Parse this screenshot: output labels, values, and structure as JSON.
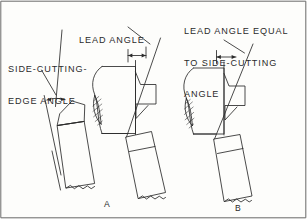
{
  "figure": {
    "title_visible": false,
    "background_color": "#fdfdfb",
    "ink_color": "#2b2b2b",
    "border": {
      "present": true,
      "color": "#5a5a5a"
    },
    "width_px": 307,
    "height_px": 219
  },
  "labels": {
    "side_cutting_edge_angle": {
      "line1": "SIDE-CUTTING-",
      "line2": "EDGE ANGLE",
      "leader": "diagonal-leader-down-right"
    },
    "lead_angle": {
      "line1": "LEAD ANGLE",
      "leader": "diagonal-leader-down-right"
    },
    "lead_angle_equal": {
      "line1": "LEAD ANGLE EQUAL",
      "line2": "TO SIDE-CUTTING",
      "line3": "ANGLE",
      "leader": "diagonal-leader-down-right"
    }
  },
  "figure_letters": {
    "center": "A",
    "right": "B"
  },
  "parts": {
    "left_tool": "tool-holder-shank-tilted",
    "center_workpiece": "hatched-workpiece-section",
    "right_workpiece": "hatched-workpiece-section",
    "center_tool": "lathe-cutting-tool",
    "right_tool": "lathe-cutting-tool"
  }
}
